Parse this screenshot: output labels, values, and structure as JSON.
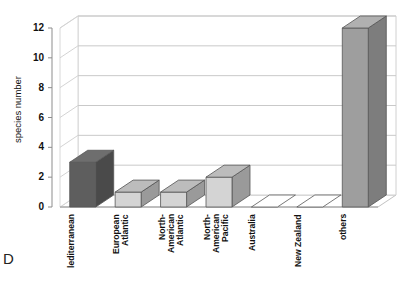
{
  "panel": {
    "letter": "D"
  },
  "chart_data": {
    "type": "bar",
    "title": "",
    "xlabel": "",
    "ylabel": "species number",
    "ylim": [
      0,
      12
    ],
    "yticks": [
      0,
      2,
      4,
      6,
      8,
      10,
      12
    ],
    "grid": true,
    "legend": "none",
    "three_d": true,
    "categories": [
      "lediterranean",
      "European\nAtlantic",
      "North-\nAmerican\nAtlantic",
      "North-\nAmerican\nPacific",
      "Australia",
      "New Zealand",
      "others"
    ],
    "values": [
      3,
      1,
      1,
      2,
      0,
      0,
      12
    ],
    "colors": {
      "bar_dark_front": "#5e5e5e",
      "bar_dark_side": "#4a4a4a",
      "bar_dark_top": "#6e6e6e",
      "bar_light_front": "#d4d4d4",
      "bar_light_side": "#9a9a9a",
      "bar_light_top": "#bcbcbc",
      "bar_other_front": "#9e9e9e",
      "bar_other_side": "#7d7d7d",
      "bar_other_top": "#b0b0b0",
      "gridline": "#c9c9c9",
      "axis": "#8d8d8d"
    },
    "series_style": [
      "dark",
      "light",
      "light",
      "light",
      "light",
      "light",
      "other"
    ]
  }
}
